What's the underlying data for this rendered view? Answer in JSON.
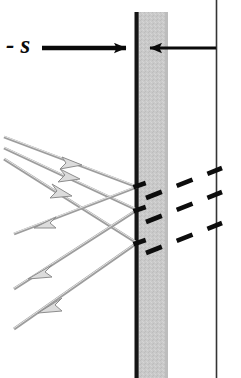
{
  "figure": {
    "type": "optics-ray-diagram",
    "width": 241,
    "height": 378,
    "background_color": "#ffffff"
  },
  "annotations": {
    "distance_label": "- s",
    "distance_label_name": "negative-s"
  },
  "colors": {
    "ray_incident": "#9a9a9a",
    "ray_outline": "#6e6e6e",
    "ray_fill": "#d8d8d8",
    "wall_line": "#141414",
    "wall_slab": "#c6c6c6",
    "wall_slab_edge": "#b4b4b4",
    "dashed_ray": "#0d0d0d",
    "arrow_black": "#0a0a0a",
    "border_line": "#2a2a2a"
  },
  "geometry": {
    "wall": {
      "black_line_x": 135,
      "black_line_width": 4,
      "slab_x": 139,
      "slab_width": 29,
      "top_y": 12,
      "bottom_y": 378
    },
    "right_border_x": 216,
    "dimension_arrow": {
      "y": 48,
      "left_start_x": 42,
      "left_end_x": 135,
      "right_start_x": 216,
      "right_end_x": 137
    },
    "incident_rays": [
      {
        "x1": 4,
        "y1": 137,
        "x2": 137,
        "y2": 187,
        "arrow_t": 0.52
      },
      {
        "x1": 4,
        "y1": 148,
        "x2": 137,
        "y2": 210,
        "arrow_t": 0.5
      },
      {
        "x1": 4,
        "y1": 159,
        "x2": 137,
        "y2": 243,
        "arrow_t": 0.48
      }
    ],
    "reflected_rays": [
      {
        "x1": 137,
        "y1": 187,
        "x2": 11,
        "y2": 235,
        "arrow_t": 0.75
      },
      {
        "x1": 137,
        "y1": 210,
        "x2": 11,
        "y2": 290,
        "arrow_t": 0.72
      },
      {
        "x1": 137,
        "y1": 243,
        "x2": 11,
        "y2": 330,
        "arrow_t": 0.7
      }
    ],
    "transmitted_dashed_rays": [
      {
        "x1": 148,
        "y1": 196,
        "x2": 216,
        "y2": 172
      },
      {
        "x1": 148,
        "y1": 219,
        "x2": 216,
        "y2": 195
      },
      {
        "x1": 148,
        "y1": 250,
        "x2": 216,
        "y2": 226
      }
    ],
    "wall_contact_marks": [
      {
        "x": 136,
        "y": 187
      },
      {
        "x": 136,
        "y": 210
      },
      {
        "x": 136,
        "y": 243
      }
    ]
  }
}
